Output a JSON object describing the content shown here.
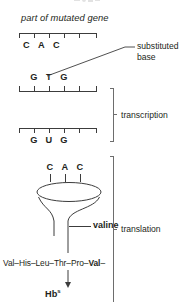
{
  "figure": {
    "caption": "part of mutated gene",
    "dna_sense_strand": {
      "bases": [
        "C",
        "A",
        "C"
      ],
      "tick_count": 6
    },
    "dna_template_strand": {
      "bases": [
        "G",
        "T",
        "G"
      ],
      "tick_count": 6,
      "mutated_base": "T"
    },
    "mrna_strand": {
      "bases": [
        "G",
        "U",
        "G"
      ],
      "tick_count": 6
    },
    "trna_anticodon": {
      "bases": [
        "C",
        "A",
        "C"
      ]
    },
    "labels": {
      "substituted_base": "substituted\nbase",
      "substituted_base_line1": "substituted",
      "substituted_base_line2": "base",
      "valine": "valine",
      "transcription": "transcription",
      "translation": "translation"
    },
    "peptide": {
      "residues_plain": "Val–His–Leu–Thr–Pro–",
      "residue_bold": "Val",
      "trailing_dash": "–"
    },
    "product": {
      "symbol": "Hb",
      "superscript": "s"
    },
    "colors": {
      "ink": "#231f20",
      "line": "#3c3c3c",
      "bracket": "#6d6d6d",
      "background": "#ffffff"
    }
  }
}
